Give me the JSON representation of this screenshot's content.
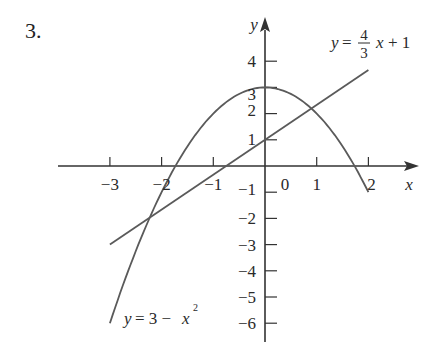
{
  "problem_number": "3.",
  "chart_data": {
    "type": "line",
    "title": "",
    "xlabel": "x",
    "ylabel": "y",
    "xlim": [
      -3.1,
      2.6
    ],
    "ylim": [
      -6.5,
      4.7
    ],
    "grid": false,
    "x_ticks": [
      -3,
      -2,
      -1,
      0,
      1,
      2
    ],
    "x_tick_labels": [
      "−3",
      "−2",
      "−1",
      "0",
      "1",
      "2"
    ],
    "y_ticks": [
      4,
      3,
      2,
      1,
      -1,
      -2,
      -3,
      -4,
      -5,
      -6
    ],
    "y_tick_labels": [
      "4",
      "3",
      "2",
      "1",
      "−1",
      "−2",
      "−3",
      "−4",
      "−5",
      "−6"
    ],
    "series": [
      {
        "name": "y = 3 − x²",
        "label_text": "y = 3 − x",
        "label_sup": "2",
        "formula": "3 - x^2",
        "x": [
          -3,
          -2.5,
          -2,
          -1.5,
          -1,
          -0.5,
          0,
          0.5,
          1,
          1.5,
          2
        ],
        "values": [
          -6,
          -3.25,
          -1,
          0.75,
          2,
          2.75,
          3,
          2.75,
          2,
          0.75,
          -1
        ]
      },
      {
        "name": "y = (4/3)x + 1",
        "label_prefix": "y =",
        "label_num": "4",
        "label_den": "3",
        "label_suffix": "x + 1",
        "formula": "(4/3)x + 1",
        "x": [
          -3,
          2
        ],
        "values": [
          -3,
          3.667
        ]
      }
    ],
    "intersections": [
      {
        "x": -2.1,
        "y": -1.8
      },
      {
        "x": 0.77,
        "y": 2.03
      }
    ],
    "annotations": [
      "y = 4/3 x + 1",
      "y = 3 − x²"
    ]
  },
  "colors": {
    "axis": "#333333",
    "curve": "#5a5a5a",
    "text": "#2a2a2a",
    "background": "#ffffff"
  }
}
